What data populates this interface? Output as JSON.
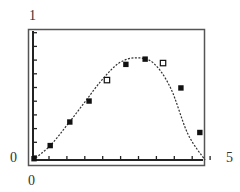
{
  "chart_data": {
    "type": "line",
    "title": "",
    "xlabel": "",
    "ylabel": "",
    "xlim": [
      0,
      5
    ],
    "ylim": [
      0,
      1
    ],
    "grid": false,
    "legend": null,
    "x_tick_labels": {
      "min": "0",
      "max": "5"
    },
    "y_tick_labels": {
      "min": "0",
      "max": "1"
    },
    "x_tick_count": 10,
    "y_tick_count": 10,
    "series": [
      {
        "name": "fitted curve",
        "style": "dotted",
        "x": [
          0,
          0.5,
          1.0,
          1.5,
          2.0,
          2.5,
          3.0,
          3.5,
          4.0,
          4.5,
          5.0
        ],
        "values": [
          0.0,
          0.11,
          0.27,
          0.44,
          0.61,
          0.74,
          0.78,
          0.74,
          0.55,
          0.2,
          0.0
        ]
      },
      {
        "name": "data points",
        "style": "markers",
        "points": [
          {
            "x": 0.03,
            "y": 0.01,
            "marker": "filled-square"
          },
          {
            "x": 0.5,
            "y": 0.11,
            "marker": "filled-square"
          },
          {
            "x": 1.07,
            "y": 0.29,
            "marker": "filled-square"
          },
          {
            "x": 1.63,
            "y": 0.45,
            "marker": "filled-square"
          },
          {
            "x": 2.15,
            "y": 0.61,
            "marker": "open-square"
          },
          {
            "x": 2.7,
            "y": 0.73,
            "marker": "filled-square"
          },
          {
            "x": 3.26,
            "y": 0.77,
            "marker": "filled-square"
          },
          {
            "x": 3.78,
            "y": 0.74,
            "marker": "open-square"
          },
          {
            "x": 4.3,
            "y": 0.55,
            "marker": "filled-square"
          },
          {
            "x": 4.85,
            "y": 0.21,
            "marker": "filled-square"
          }
        ]
      }
    ]
  },
  "labels": {
    "y_max": "1",
    "y_min": "0",
    "x_min": "0",
    "x_max": "5"
  }
}
